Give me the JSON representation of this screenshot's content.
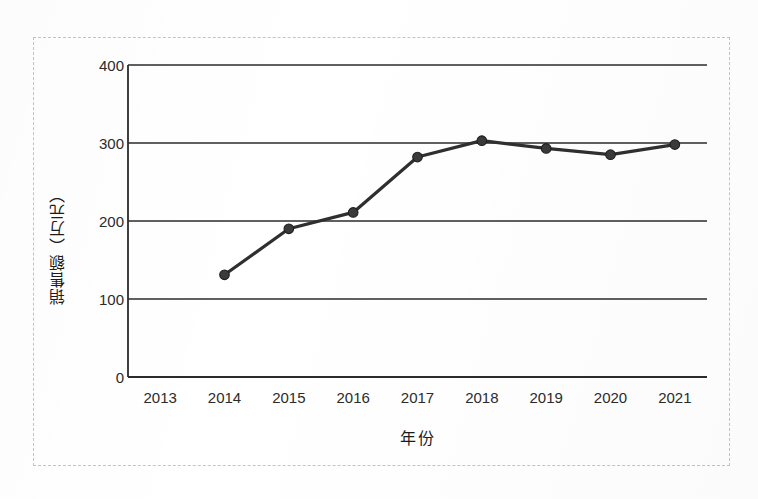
{
  "chart_data": {
    "type": "line",
    "title": "",
    "xlabel": "年份",
    "ylabel": "销售额（万元）",
    "categories": [
      "2013",
      "2014",
      "2015",
      "2016",
      "2017",
      "2018",
      "2019",
      "2020",
      "2021"
    ],
    "series": [
      {
        "name": "销售额",
        "values": [
          null,
          131,
          190,
          211,
          282,
          303,
          293,
          285,
          298
        ]
      }
    ],
    "ylim": [
      0,
      400
    ],
    "y_ticks": [
      "0",
      "100",
      "200",
      "300",
      "400"
    ],
    "y_tick_values": [
      0,
      100,
      200,
      300,
      400
    ],
    "grid": true,
    "grid_axis": "y",
    "legend": false,
    "markers": true,
    "marker_shape": "circle",
    "line_color": "#2f2f2f",
    "marker_color": "#3a3a3a",
    "grid_color": "#2b2b2b",
    "axis_color": "#2b2b2b",
    "background_color": "#ffffff",
    "frame_color": "#c3c3c8"
  },
  "figure": {
    "border_style": "dashed",
    "caption": ""
  }
}
